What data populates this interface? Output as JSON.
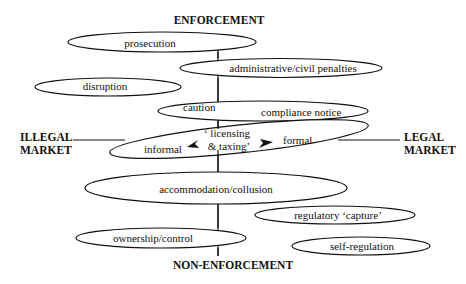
{
  "axes": {
    "top": "ENFORCEMENT",
    "bottom": "NON-ENFORCEMENT",
    "left_line1": "ILLEGAL",
    "left_line2": "MARKET",
    "right_line1": "LEGAL",
    "right_line2": "MARKET"
  },
  "nodes": {
    "prosecution": "prosecution",
    "administrative": "administrative/civil penalties",
    "disruption": "disruption",
    "caution": "caution",
    "compliance": "compliance notice",
    "licensing_line1": "‘ licensing",
    "licensing_line2": "& taxing’",
    "informal": "informal",
    "formal": "formal",
    "accommodation": "accommodation/collusion",
    "regulatory_capture": "regulatory ‘capture’",
    "ownership": "ownership/control",
    "self_regulation": "self-regulation"
  },
  "colors": {
    "stroke": "#111111",
    "background": "#ffffff"
  }
}
